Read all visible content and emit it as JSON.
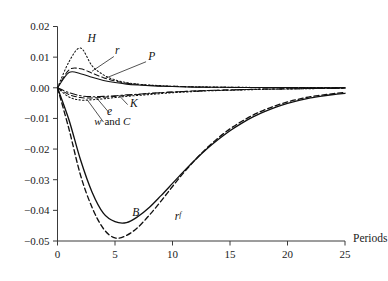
{
  "chart_data": {
    "type": "line",
    "title": "",
    "xlabel": "Periods",
    "ylabel": "",
    "xlim": [
      0,
      25
    ],
    "ylim": [
      -0.05,
      0.02
    ],
    "grid": false,
    "legend": "inline-annotations",
    "xticks": [
      0,
      5,
      10,
      15,
      20,
      25
    ],
    "xticklabels": [
      "0",
      "5",
      "10",
      "15",
      "20",
      "25"
    ],
    "yticks": [
      0.02,
      0.01,
      0.0,
      -0.01,
      -0.02,
      -0.03,
      -0.04,
      -0.05
    ],
    "yticklabels": [
      "0.02",
      "0.01",
      "0.00",
      "-0.01",
      "-0.02",
      "-0.03",
      "-0.04",
      "-0.05"
    ],
    "x": [
      0,
      1,
      2,
      3,
      4,
      5,
      6,
      7,
      8,
      9,
      10,
      11,
      12,
      13,
      14,
      15,
      16,
      17,
      18,
      19,
      20,
      21,
      22,
      23,
      24,
      25
    ],
    "series": [
      {
        "name": "H",
        "label": "H",
        "style": "dotted",
        "color": "#111111",
        "values": [
          0.0,
          0.0085,
          0.013,
          0.0072,
          0.0042,
          0.0026,
          0.0017,
          0.0012,
          0.0009,
          0.0007,
          0.0005,
          0.0004,
          0.0003,
          0.0003,
          0.0002,
          0.0002,
          0.0002,
          0.0001,
          0.0001,
          0.0001,
          0.0001,
          0.0001,
          0.0001,
          0.0001,
          0.0,
          0.0
        ]
      },
      {
        "name": "r",
        "label": "r",
        "style": "dashed",
        "color": "#111111",
        "values": [
          0.0,
          0.0058,
          0.0062,
          0.0048,
          0.0033,
          0.0022,
          0.0015,
          0.0011,
          0.0008,
          0.0006,
          0.0005,
          0.0004,
          0.0003,
          0.0002,
          0.0002,
          0.0002,
          0.0001,
          0.0001,
          0.0001,
          0.0001,
          0.0001,
          0.0001,
          0.0,
          0.0,
          0.0,
          0.0
        ]
      },
      {
        "name": "P",
        "label": "P",
        "style": "solid",
        "color": "#111111",
        "values": [
          0.0,
          0.005,
          0.0046,
          0.0034,
          0.0024,
          0.0017,
          0.0012,
          0.0009,
          0.0007,
          0.0005,
          0.0004,
          0.0003,
          0.0002,
          0.0002,
          0.0002,
          0.0001,
          0.0001,
          0.0001,
          0.0001,
          0.0001,
          0.0001,
          0.0,
          0.0,
          0.0,
          0.0,
          0.0
        ]
      },
      {
        "name": "K",
        "label": "K",
        "style": "dashdot",
        "color": "#111111",
        "values": [
          0.0,
          -0.0016,
          -0.0026,
          -0.0029,
          -0.0028,
          -0.0026,
          -0.0023,
          -0.0021,
          -0.0018,
          -0.0016,
          -0.0014,
          -0.0012,
          -0.0011,
          -0.0009,
          -0.0008,
          -0.0007,
          -0.0006,
          -0.0005,
          -0.0004,
          -0.0004,
          -0.0003,
          -0.0003,
          -0.0002,
          -0.0002,
          -0.0002,
          -0.0001
        ]
      },
      {
        "name": "e",
        "label": "e",
        "style": "dashed",
        "color": "#111111",
        "values": [
          0.0,
          -0.0022,
          -0.0032,
          -0.0033,
          -0.0031,
          -0.0028,
          -0.0025,
          -0.0022,
          -0.0019,
          -0.0016,
          -0.0014,
          -0.0012,
          -0.001,
          -0.0009,
          -0.0008,
          -0.0007,
          -0.0006,
          -0.0005,
          -0.0004,
          -0.0004,
          -0.0003,
          -0.0003,
          -0.0002,
          -0.0002,
          -0.0001,
          -0.0001
        ]
      },
      {
        "name": "w and C",
        "label": "w and C",
        "style": "dotted",
        "color": "#111111",
        "values": [
          0.0,
          -0.003,
          -0.004,
          -0.0039,
          -0.0036,
          -0.0032,
          -0.0028,
          -0.0025,
          -0.0022,
          -0.0019,
          -0.0016,
          -0.0014,
          -0.0012,
          -0.001,
          -0.0009,
          -0.0008,
          -0.0007,
          -0.0006,
          -0.0005,
          -0.0004,
          -0.0004,
          -0.0003,
          -0.0003,
          -0.0002,
          -0.0002,
          -0.0001
        ]
      },
      {
        "name": "B",
        "label": "B",
        "style": "solid",
        "color": "#111111",
        "values": [
          0.0,
          -0.0105,
          -0.0235,
          -0.034,
          -0.041,
          -0.0437,
          -0.044,
          -0.042,
          -0.039,
          -0.0352,
          -0.0312,
          -0.0272,
          -0.0234,
          -0.0199,
          -0.0168,
          -0.014,
          -0.0116,
          -0.0095,
          -0.0078,
          -0.0063,
          -0.0051,
          -0.0041,
          -0.0033,
          -0.0027,
          -0.0022,
          -0.0018
        ]
      },
      {
        "name": "rf",
        "label": "r",
        "label_sup": "f",
        "style": "dashed",
        "color": "#111111",
        "values": [
          0.0,
          -0.0135,
          -0.0285,
          -0.039,
          -0.046,
          -0.049,
          -0.0482,
          -0.0455,
          -0.0415,
          -0.037,
          -0.0322,
          -0.0276,
          -0.0234,
          -0.0196,
          -0.0163,
          -0.0134,
          -0.011,
          -0.0089,
          -0.0072,
          -0.0058,
          -0.0046,
          -0.0037,
          -0.0029,
          -0.0024,
          -0.0019,
          -0.0015
        ]
      }
    ],
    "annotations": [
      {
        "text": "H",
        "x": 2.6,
        "y": 0.015
      },
      {
        "text": "r",
        "x": 5.0,
        "y": 0.011
      },
      {
        "text": "P",
        "x": 7.9,
        "y": 0.0092
      },
      {
        "text": "K",
        "x": 6.3,
        "y": -0.0062
      },
      {
        "text": "e",
        "x": 4.3,
        "y": -0.0088
      },
      {
        "text": "w and C",
        "x": 3.2,
        "y": -0.012
      },
      {
        "text": "B",
        "x": 6.5,
        "y": -0.0418
      },
      {
        "text": "rf",
        "x": 10.2,
        "y": -0.0432
      }
    ]
  }
}
